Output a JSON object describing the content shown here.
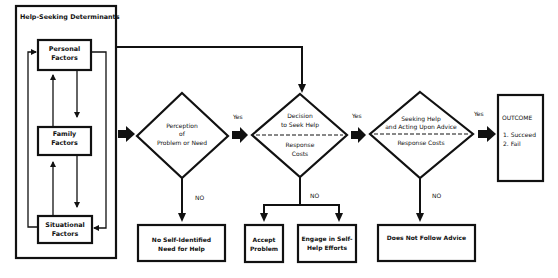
{
  "colors": {
    "ink": "#111111",
    "background": "#ffffff"
  },
  "determinants": {
    "title": "Help-Seeking Determinants",
    "personal": [
      "Personal",
      "Factors"
    ],
    "family": [
      "Family",
      "Factors"
    ],
    "situational": [
      "Situational",
      "Factors"
    ]
  },
  "perception": {
    "lines": [
      "Perception",
      "of",
      "Problem or Need"
    ]
  },
  "decision": {
    "top": [
      "Decision",
      "to Seek Help"
    ],
    "bottom": [
      "Response",
      "Costs"
    ]
  },
  "seeking": {
    "top": [
      "Seeking Help",
      "and Acting Upon Advice"
    ],
    "bottom": [
      "Response Costs"
    ]
  },
  "outcome": {
    "title": "OUTCOME",
    "items": [
      "1. Succeed",
      "2. Fail"
    ]
  },
  "edge_labels": {
    "yes": "Yes",
    "no": "NO"
  },
  "terminals": {
    "no_need": [
      "No Self-Identified",
      "Need for Help"
    ],
    "accept": [
      "Accept",
      "Problem"
    ],
    "engage": [
      "Engage in Self-",
      "Help Efforts"
    ],
    "not_follow": [
      "Does Not Follow Advice"
    ]
  }
}
